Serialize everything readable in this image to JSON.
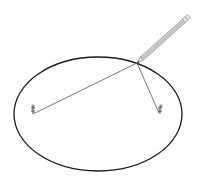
{
  "diagram": {
    "ellipse": {
      "cx": 98,
      "cy": 114,
      "rx": 84,
      "ry": 57,
      "stroke": "#1a1a1a"
    },
    "pencil_tip": {
      "x": 137,
      "y": 63
    },
    "pencil_end": {
      "x": 188,
      "y": 17
    },
    "pins": [
      {
        "name": "left-focus-pin",
        "x": 34,
        "y": 113
      },
      {
        "name": "right-focus-pin",
        "x": 160,
        "y": 113
      }
    ],
    "string_color": "#555555",
    "pencil_color": "#c8c8c8"
  }
}
